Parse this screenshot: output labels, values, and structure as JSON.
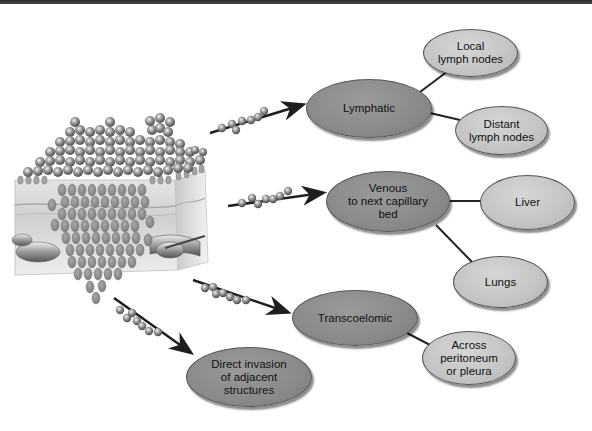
{
  "diagram": {
    "colors": {
      "primary_node": "#8a8a8a",
      "secondary_node": "#c4c4c4",
      "connector": "#222222",
      "top_bar": "#333333"
    },
    "source": {
      "label": "Primary tumour in tissue",
      "icon": "tumor-tissue-illustration"
    },
    "routes": [
      {
        "id": "lymphatic",
        "label": "Lymphatic",
        "destinations": [
          {
            "id": "local-lymph-nodes",
            "label": "Local\nlymph nodes"
          },
          {
            "id": "distant-lymph-nodes",
            "label": "Distant\nlymph nodes"
          }
        ]
      },
      {
        "id": "venous",
        "label": "Venous\nto next capillary\nbed",
        "destinations": [
          {
            "id": "liver",
            "label": "Liver"
          },
          {
            "id": "lungs",
            "label": "Lungs"
          }
        ]
      },
      {
        "id": "transcoelomic",
        "label": "Transcoelomic",
        "destinations": [
          {
            "id": "across-peritoneum",
            "label": "Across\nperitoneum\nor pleura"
          }
        ]
      },
      {
        "id": "direct-invasion",
        "label": "Direct invasion\nof adjacent\nstructures",
        "destinations": []
      }
    ]
  }
}
